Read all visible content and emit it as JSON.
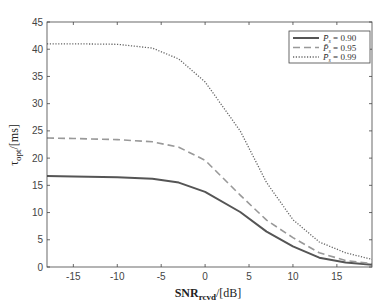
{
  "chart_data": {
    "type": "line",
    "title": "",
    "xlabel": "SNR_rcvd / [dB]",
    "xlabel_main": "SNR",
    "xlabel_sub": "rcvd",
    "xlabel_unit": "/[dB]",
    "ylabel": "τ_opt / [ms]",
    "ylabel_main": "τ",
    "ylabel_sub": "opt",
    "ylabel_unit": "/[ms]",
    "xlim": [
      -18,
      19
    ],
    "ylim": [
      0,
      45
    ],
    "xticks": [
      -15,
      -10,
      -5,
      0,
      5,
      10,
      15
    ],
    "yticks": [
      0,
      5,
      10,
      15,
      20,
      25,
      30,
      35,
      40,
      45
    ],
    "grid": false,
    "legend_position": "upper right",
    "x": [
      -18,
      -15,
      -10,
      -6,
      -3,
      0,
      4,
      7,
      10,
      13,
      16,
      19
    ],
    "series": [
      {
        "name": "P̄_s = 0.90",
        "label_prefix": "P̄",
        "label_sub": "s",
        "label_value": "= 0.90",
        "style": "solid",
        "color": "#555555",
        "values": [
          16.7,
          16.6,
          16.5,
          16.2,
          15.5,
          13.8,
          10.1,
          6.5,
          3.8,
          1.7,
          0.8,
          0.4
        ]
      },
      {
        "name": "P̄_s = 0.95",
        "label_prefix": "P̄",
        "label_sub": "s",
        "label_value": "= 0.95",
        "style": "dashed",
        "color": "#999999",
        "values": [
          23.7,
          23.6,
          23.4,
          23.0,
          22.0,
          19.6,
          13.2,
          8.6,
          5.4,
          2.6,
          1.2,
          0.6
        ]
      },
      {
        "name": "P̄_s = 0.99",
        "label_prefix": "P̄",
        "label_sub": "s",
        "label_value": "= 0.99",
        "style": "dotted",
        "color": "#666666",
        "values": [
          41.0,
          41.0,
          40.9,
          40.2,
          38.2,
          34.0,
          25.0,
          15.5,
          8.7,
          4.6,
          2.6,
          1.4
        ]
      }
    ]
  }
}
